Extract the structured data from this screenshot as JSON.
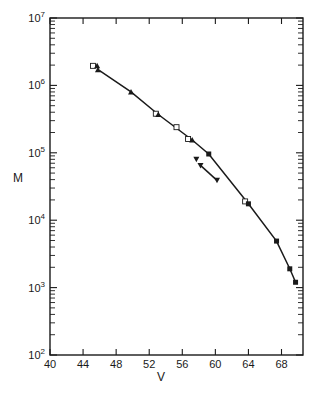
{
  "chart_data": {
    "type": "scatter",
    "title": "",
    "xlabel": "V",
    "ylabel": "M",
    "xlim": [
      40,
      70.6
    ],
    "ylim": [
      100,
      10000000
    ],
    "yscale": "log",
    "xticks": [
      40,
      44,
      48,
      52,
      56,
      60,
      64,
      68
    ],
    "yticks": [
      {
        "base": "10",
        "exp": "2",
        "value": 100
      },
      {
        "base": "10",
        "exp": "3",
        "value": 1000
      },
      {
        "base": "10",
        "exp": "4",
        "value": 10000
      },
      {
        "base": "10",
        "exp": "5",
        "value": 100000
      },
      {
        "base": "10",
        "exp": "6",
        "value": 1000000
      },
      {
        "base": "10",
        "exp": "7",
        "value": 10000000
      }
    ],
    "grid": false,
    "legend": null,
    "series": [
      {
        "name": "open squares",
        "marker": "open-square",
        "points": [
          [
            45.2,
            1950000
          ],
          [
            52.8,
            380000
          ],
          [
            55.3,
            240000
          ],
          [
            56.7,
            160000
          ],
          [
            63.6,
            19000
          ]
        ]
      },
      {
        "name": "filled triangles",
        "marker": "triangle-up",
        "points": [
          [
            45.7,
            1950000
          ],
          [
            45.8,
            1700000
          ],
          [
            49.8,
            800000
          ],
          [
            53.1,
            370000
          ],
          [
            57.2,
            155000
          ]
        ]
      },
      {
        "name": "filled squares",
        "marker": "filled-square",
        "points": [
          [
            59.2,
            96000
          ],
          [
            64.0,
            17500
          ],
          [
            67.4,
            4900
          ],
          [
            69.0,
            1900
          ],
          [
            69.7,
            1200
          ]
        ]
      },
      {
        "name": "inverted triangles",
        "marker": "triangle-down",
        "points": [
          [
            57.7,
            80000
          ],
          [
            58.2,
            65000
          ],
          [
            60.2,
            39000
          ]
        ]
      }
    ],
    "curves": [
      {
        "name": "main fit",
        "style": "solid",
        "points": [
          [
            46.0,
            1650000
          ],
          [
            49.8,
            800000
          ],
          [
            53.1,
            370000
          ],
          [
            57.2,
            155000
          ],
          [
            59.2,
            96000
          ],
          [
            64.0,
            17500
          ],
          [
            67.4,
            4900
          ],
          [
            69.0,
            1900
          ],
          [
            69.7,
            1200
          ]
        ]
      },
      {
        "name": "inverted-triangle fit",
        "style": "solid",
        "points": [
          [
            58.2,
            65000
          ],
          [
            60.2,
            39000
          ]
        ]
      }
    ],
    "annotations": []
  }
}
